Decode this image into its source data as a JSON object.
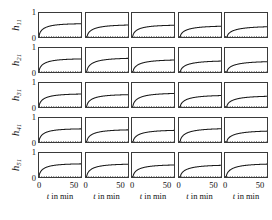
{
  "figure": {
    "rows": 5,
    "cols": 5,
    "background": "#ffffff",
    "axis_color": "#3a3a3a",
    "curve_color": "#1a1a1a",
    "dotted_color": "#555555"
  },
  "axes": {
    "y_ticks": [
      "0",
      "1"
    ],
    "y_tick_values": [
      0,
      1
    ],
    "x_ticks": [
      "0",
      "50"
    ],
    "x_tick_values": [
      0,
      50
    ],
    "x_caption_prefix": "t",
    "x_caption_suffix": " in min",
    "x_caption": "t in min",
    "ylim": [
      0,
      1
    ],
    "xlim": [
      0,
      60
    ]
  },
  "row_labels": [
    {
      "base": "h",
      "sub": "11",
      "text": "h11"
    },
    {
      "base": "h",
      "sub": "21",
      "text": "h21"
    },
    {
      "base": "h",
      "sub": "31",
      "text": "h31"
    },
    {
      "base": "h",
      "sub": "41",
      "text": "h41"
    },
    {
      "base": "h",
      "sub": "51",
      "text": "h51"
    }
  ],
  "chart_data": {
    "type": "line",
    "title": "",
    "xlabel": "t in min",
    "ylabel": "h_i1",
    "xlim": [
      0,
      60
    ],
    "ylim": [
      0,
      1
    ],
    "grid": false,
    "legend": "none",
    "layout": "5x5 small-multiples matrix",
    "x": [
      0,
      1,
      2,
      3,
      4,
      5,
      6,
      8,
      10,
      12,
      15,
      18,
      21,
      25,
      30,
      35,
      40,
      45,
      50,
      55,
      60
    ],
    "reference_line": {
      "value": 0,
      "style": "dotted",
      "label": "zero reference"
    },
    "panels": [
      {
        "row": 0,
        "col": 0,
        "label": "h11",
        "gain": 0.565,
        "lag": 0.0,
        "tau": 7.0,
        "values": [
          0.0,
          0.075,
          0.141,
          0.198,
          0.247,
          0.29,
          0.327,
          0.387,
          0.431,
          0.464,
          0.5,
          0.524,
          0.54,
          0.554,
          0.563,
          0.565,
          0.565,
          0.565,
          0.565,
          0.565,
          0.565
        ]
      },
      {
        "row": 0,
        "col": 1,
        "label": "h11",
        "gain": 0.52,
        "lag": 1.6,
        "tau": 9.0,
        "values": [
          0.0,
          0.0,
          0.022,
          0.048,
          0.073,
          0.097,
          0.119,
          0.159,
          0.194,
          0.224,
          0.262,
          0.292,
          0.317,
          0.345,
          0.375,
          0.397,
          0.414,
          0.427,
          0.437,
          0.445,
          0.451
        ]
      },
      {
        "row": 0,
        "col": 2,
        "label": "h11",
        "gain": 0.505,
        "lag": 1.0,
        "tau": 8.0,
        "values": [
          0.0,
          0.0,
          0.06,
          0.093,
          0.123,
          0.15,
          0.174,
          0.217,
          0.253,
          0.283,
          0.32,
          0.349,
          0.372,
          0.397,
          0.422,
          0.44,
          0.453,
          0.463,
          0.47,
          0.476,
          0.48
        ]
      },
      {
        "row": 0,
        "col": 3,
        "label": "h11",
        "gain": 0.47,
        "lag": 1.8,
        "tau": 9.5,
        "values": [
          0.0,
          0.0,
          0.01,
          0.035,
          0.059,
          0.081,
          0.101,
          0.138,
          0.17,
          0.198,
          0.234,
          0.263,
          0.287,
          0.314,
          0.343,
          0.365,
          0.382,
          0.395,
          0.405,
          0.412,
          0.418
        ]
      },
      {
        "row": 0,
        "col": 4,
        "label": "h11",
        "gain": 0.455,
        "lag": 3.0,
        "tau": 11.0,
        "values": [
          0.0,
          0.0,
          0.0,
          0.0,
          0.012,
          0.032,
          0.051,
          0.086,
          0.117,
          0.144,
          0.179,
          0.209,
          0.234,
          0.263,
          0.294,
          0.318,
          0.337,
          0.352,
          0.363,
          0.372,
          0.379
        ]
      },
      {
        "row": 1,
        "col": 0,
        "label": "h21",
        "gain": 0.56,
        "lag": 0.0,
        "tau": 7.5,
        "values": [
          0.0,
          0.07,
          0.133,
          0.188,
          0.236,
          0.279,
          0.316,
          0.377,
          0.423,
          0.458,
          0.496,
          0.521,
          0.539,
          0.553,
          0.562,
          0.56,
          0.56,
          0.56,
          0.56,
          0.56,
          0.56
        ]
      },
      {
        "row": 1,
        "col": 1,
        "label": "h21",
        "gain": 0.59,
        "lag": 1.2,
        "tau": 8.5,
        "values": [
          0.0,
          0.0,
          0.045,
          0.086,
          0.123,
          0.157,
          0.188,
          0.242,
          0.287,
          0.325,
          0.372,
          0.409,
          0.439,
          0.471,
          0.504,
          0.528,
          0.545,
          0.557,
          0.566,
          0.572,
          0.577
        ]
      },
      {
        "row": 1,
        "col": 2,
        "label": "h21",
        "gain": 0.52,
        "lag": 1.5,
        "tau": 9.0,
        "values": [
          0.0,
          0.0,
          0.021,
          0.049,
          0.075,
          0.099,
          0.122,
          0.163,
          0.199,
          0.23,
          0.269,
          0.3,
          0.326,
          0.354,
          0.385,
          0.407,
          0.424,
          0.437,
          0.447,
          0.455,
          0.461
        ]
      },
      {
        "row": 1,
        "col": 3,
        "label": "h21",
        "gain": 0.48,
        "lag": 2.0,
        "tau": 10.0,
        "values": [
          0.0,
          0.0,
          0.0,
          0.023,
          0.047,
          0.069,
          0.09,
          0.127,
          0.159,
          0.188,
          0.224,
          0.254,
          0.279,
          0.307,
          0.337,
          0.36,
          0.378,
          0.391,
          0.402,
          0.41,
          0.416
        ]
      },
      {
        "row": 1,
        "col": 4,
        "label": "h21",
        "gain": 0.455,
        "lag": 2.8,
        "tau": 10.5,
        "values": [
          0.0,
          0.0,
          0.0,
          0.002,
          0.02,
          0.041,
          0.061,
          0.097,
          0.129,
          0.157,
          0.193,
          0.223,
          0.248,
          0.277,
          0.307,
          0.33,
          0.348,
          0.362,
          0.373,
          0.381,
          0.387
        ]
      },
      {
        "row": 2,
        "col": 0,
        "label": "h31",
        "gain": 0.555,
        "lag": 0.0,
        "tau": 7.5,
        "values": [
          0.0,
          0.069,
          0.132,
          0.187,
          0.234,
          0.276,
          0.313,
          0.374,
          0.419,
          0.454,
          0.492,
          0.517,
          0.535,
          0.548,
          0.555,
          0.555,
          0.555,
          0.555,
          0.555,
          0.555,
          0.555
        ]
      },
      {
        "row": 2,
        "col": 1,
        "label": "h31",
        "gain": 0.53,
        "lag": 1.0,
        "tau": 8.0,
        "values": [
          0.0,
          0.0,
          0.063,
          0.098,
          0.129,
          0.157,
          0.183,
          0.228,
          0.266,
          0.297,
          0.336,
          0.366,
          0.39,
          0.417,
          0.443,
          0.461,
          0.475,
          0.485,
          0.493,
          0.499,
          0.503
        ]
      },
      {
        "row": 2,
        "col": 2,
        "label": "h31",
        "gain": 0.585,
        "lag": 1.2,
        "tau": 8.5,
        "values": [
          0.0,
          0.0,
          0.044,
          0.085,
          0.122,
          0.156,
          0.186,
          0.24,
          0.285,
          0.322,
          0.369,
          0.405,
          0.435,
          0.467,
          0.5,
          0.523,
          0.54,
          0.552,
          0.561,
          0.567,
          0.572
        ]
      },
      {
        "row": 2,
        "col": 3,
        "label": "h31",
        "gain": 0.5,
        "lag": 1.8,
        "tau": 9.5,
        "values": [
          0.0,
          0.0,
          0.011,
          0.037,
          0.063,
          0.086,
          0.108,
          0.147,
          0.181,
          0.211,
          0.249,
          0.28,
          0.306,
          0.334,
          0.365,
          0.388,
          0.407,
          0.42,
          0.431,
          0.439,
          0.445
        ]
      },
      {
        "row": 2,
        "col": 4,
        "label": "h31",
        "gain": 0.47,
        "lag": 2.5,
        "tau": 10.0,
        "values": [
          0.0,
          0.0,
          0.0,
          0.012,
          0.034,
          0.055,
          0.075,
          0.112,
          0.145,
          0.174,
          0.211,
          0.241,
          0.267,
          0.295,
          0.326,
          0.349,
          0.367,
          0.381,
          0.392,
          0.4,
          0.406
        ]
      },
      {
        "row": 3,
        "col": 0,
        "label": "h41",
        "gain": 0.56,
        "lag": 0.0,
        "tau": 7.0,
        "values": [
          0.0,
          0.075,
          0.141,
          0.198,
          0.247,
          0.289,
          0.326,
          0.386,
          0.43,
          0.463,
          0.499,
          0.523,
          0.539,
          0.552,
          0.56,
          0.56,
          0.56,
          0.56,
          0.56,
          0.56,
          0.56
        ]
      },
      {
        "row": 3,
        "col": 1,
        "label": "h41",
        "gain": 0.525,
        "lag": 1.2,
        "tau": 8.5,
        "values": [
          0.0,
          0.0,
          0.04,
          0.076,
          0.109,
          0.14,
          0.167,
          0.215,
          0.255,
          0.289,
          0.331,
          0.364,
          0.391,
          0.419,
          0.449,
          0.47,
          0.485,
          0.496,
          0.504,
          0.509,
          0.514
        ]
      },
      {
        "row": 3,
        "col": 2,
        "label": "h41",
        "gain": 0.505,
        "lag": 1.6,
        "tau": 9.0,
        "values": [
          0.0,
          0.0,
          0.018,
          0.044,
          0.068,
          0.091,
          0.112,
          0.151,
          0.185,
          0.215,
          0.252,
          0.282,
          0.307,
          0.335,
          0.365,
          0.387,
          0.404,
          0.417,
          0.427,
          0.435,
          0.441
        ]
      },
      {
        "row": 3,
        "col": 3,
        "label": "h41",
        "gain": 0.575,
        "lag": 1.6,
        "tau": 9.0,
        "values": [
          0.0,
          0.0,
          0.021,
          0.051,
          0.078,
          0.104,
          0.128,
          0.172,
          0.211,
          0.245,
          0.287,
          0.321,
          0.35,
          0.382,
          0.416,
          0.44,
          0.46,
          0.474,
          0.485,
          0.494,
          0.501
        ]
      },
      {
        "row": 3,
        "col": 4,
        "label": "h41",
        "gain": 0.48,
        "lag": 2.6,
        "tau": 10.5,
        "values": [
          0.0,
          0.0,
          0.0,
          0.006,
          0.025,
          0.047,
          0.068,
          0.105,
          0.138,
          0.167,
          0.204,
          0.235,
          0.261,
          0.29,
          0.322,
          0.345,
          0.364,
          0.378,
          0.389,
          0.398,
          0.404
        ]
      },
      {
        "row": 4,
        "col": 0,
        "label": "h51",
        "gain": 0.56,
        "lag": 0.0,
        "tau": 7.0,
        "values": [
          0.0,
          0.075,
          0.141,
          0.198,
          0.246,
          0.289,
          0.326,
          0.386,
          0.43,
          0.463,
          0.499,
          0.523,
          0.539,
          0.552,
          0.56,
          0.56,
          0.56,
          0.56,
          0.56,
          0.56,
          0.56
        ]
      },
      {
        "row": 4,
        "col": 1,
        "label": "h51",
        "gain": 0.55,
        "lag": 1.0,
        "tau": 8.0,
        "values": [
          0.0,
          0.0,
          0.065,
          0.102,
          0.134,
          0.163,
          0.19,
          0.237,
          0.276,
          0.309,
          0.349,
          0.38,
          0.405,
          0.433,
          0.46,
          0.479,
          0.493,
          0.504,
          0.511,
          0.517,
          0.522
        ]
      },
      {
        "row": 4,
        "col": 2,
        "label": "h51",
        "gain": 0.52,
        "lag": 1.5,
        "tau": 8.5,
        "values": [
          0.0,
          0.0,
          0.025,
          0.057,
          0.086,
          0.113,
          0.138,
          0.182,
          0.22,
          0.253,
          0.294,
          0.327,
          0.354,
          0.383,
          0.413,
          0.435,
          0.451,
          0.463,
          0.472,
          0.479,
          0.484
        ]
      },
      {
        "row": 4,
        "col": 3,
        "label": "h51",
        "gain": 0.51,
        "lag": 2.0,
        "tau": 9.5,
        "values": [
          0.0,
          0.0,
          0.0,
          0.024,
          0.05,
          0.074,
          0.096,
          0.136,
          0.17,
          0.201,
          0.239,
          0.27,
          0.296,
          0.325,
          0.356,
          0.379,
          0.397,
          0.411,
          0.422,
          0.43,
          0.436
        ]
      },
      {
        "row": 4,
        "col": 4,
        "label": "h51",
        "gain": 0.56,
        "lag": 1.8,
        "tau": 9.0,
        "values": [
          0.0,
          0.0,
          0.013,
          0.043,
          0.071,
          0.097,
          0.121,
          0.165,
          0.203,
          0.236,
          0.278,
          0.312,
          0.341,
          0.372,
          0.405,
          0.429,
          0.448,
          0.462,
          0.473,
          0.481,
          0.488
        ]
      }
    ]
  }
}
